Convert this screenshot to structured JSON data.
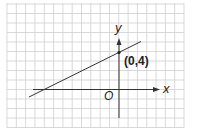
{
  "figure": {
    "type": "coordinate-plane-line",
    "grid": {
      "cols": 19,
      "rows": 13,
      "color": "#cfcfcf",
      "background": "#ffffff"
    },
    "axes": {
      "x_label": "x",
      "y_label": "y",
      "origin_label": "O",
      "color": "#333333"
    },
    "point": {
      "label": "(0,4)",
      "x": 0,
      "y": 4
    },
    "line": {
      "equation": "y = 0.5x + 4",
      "slope": 0.5,
      "y_intercept": 4,
      "x_intercept": -8,
      "color": "#333333"
    }
  }
}
